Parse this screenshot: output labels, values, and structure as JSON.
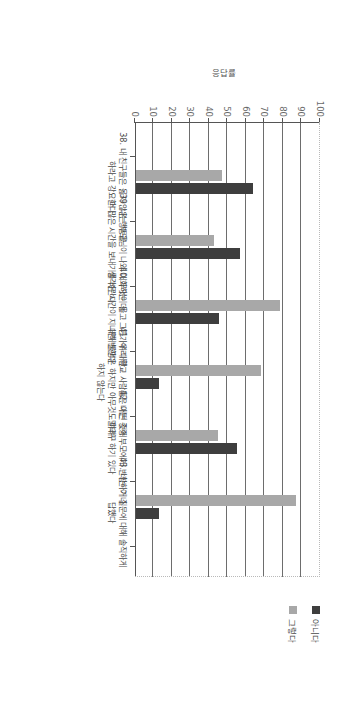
{
  "chart_data": {
    "type": "bar",
    "title": "",
    "subtitle": "",
    "xlabel": "",
    "ylabel": "응답률",
    "ylim": [
      0,
      100
    ],
    "ytick_labels": [
      "0",
      "10",
      "20",
      "30",
      "40",
      "50",
      "60",
      "70",
      "80",
      "90",
      "100"
    ],
    "ytick_values": [
      0,
      10,
      20,
      30,
      40,
      50,
      60,
      70,
      80,
      90,
      100
    ],
    "grid": true,
    "legend_position": "right",
    "orientation": "vertical-bars-page-rotated-90",
    "categories": [
      "38. 내 친구들은 옳지 않은 행동을 하라고 강요한다",
      "39. 나는 부모님이 나와 대화하는 데 더 많은 시간을 보내기를 바란다",
      "40. 무엇이 옳고 그른가에 대한 생각은 시간이 지나면 변한다",
      "41. 우리 학교 사람들은 어떤 것에 대해 불평은 하지만 아무것도 하려 하지 않는다",
      "42. 나는 종종 부모에게 반항하거나 말대꾸 하기 있다",
      "43. 나는 이 질문에 대해 솔직하게 답했다"
    ],
    "series": [
      {
        "name": "그렇다",
        "color": "#a8a8a8",
        "values": [
          46.7,
          42.4,
          78.0,
          67.7,
          44.5,
          86.7
        ]
      },
      {
        "name": "아니다",
        "color": "#3e3e3e",
        "values": [
          63.0,
          56.4,
          45.0,
          12.6,
          54.7,
          12.3
        ]
      }
    ]
  },
  "legend": {
    "items": [
      {
        "label": "아니다",
        "color": "#3e3e3e"
      },
      {
        "label": "그렇다",
        "color": "#a8a8a8"
      }
    ]
  },
  "axis": {
    "y_title": "응답률"
  }
}
